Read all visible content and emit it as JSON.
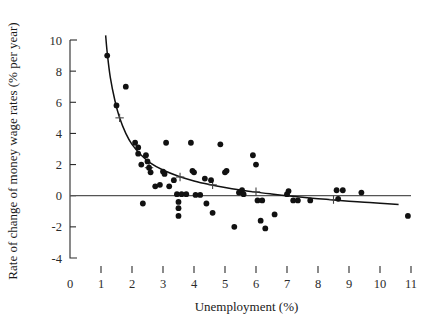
{
  "chart_data": {
    "type": "scatter",
    "title": "",
    "xlabel": "Unemployment (%)",
    "ylabel": "Rate of change of money wage rates (% per year)",
    "xlim": [
      0,
      11
    ],
    "ylim": [
      -4,
      10
    ],
    "grid": false,
    "legend": null,
    "xticks": [
      0,
      1,
      2,
      3,
      4,
      5,
      6,
      7,
      8,
      9,
      10,
      11
    ],
    "xtick_labels": [
      "0",
      "1",
      "2",
      "3",
      "4",
      "5",
      "6",
      "7",
      "8",
      "9",
      "10",
      "11"
    ],
    "yticks": [
      -4,
      -2,
      0,
      2,
      4,
      6,
      8,
      10
    ],
    "ytick_labels": [
      "-4",
      "-2",
      "0",
      "2",
      "4",
      "6",
      "8",
      "10"
    ],
    "points": [
      [
        1.2,
        9.0
      ],
      [
        1.5,
        5.8
      ],
      [
        1.8,
        7.0
      ],
      [
        2.1,
        3.4
      ],
      [
        2.2,
        3.1
      ],
      [
        2.2,
        2.7
      ],
      [
        2.3,
        2.0
      ],
      [
        2.45,
        2.6
      ],
      [
        2.5,
        2.2
      ],
      [
        2.55,
        1.8
      ],
      [
        2.6,
        1.5
      ],
      [
        2.35,
        -0.5
      ],
      [
        2.75,
        0.6
      ],
      [
        2.9,
        0.7
      ],
      [
        3.0,
        1.55
      ],
      [
        3.05,
        1.4
      ],
      [
        3.1,
        3.4
      ],
      [
        3.2,
        0.6
      ],
      [
        3.35,
        1.0
      ],
      [
        3.45,
        0.1
      ],
      [
        3.5,
        -0.4
      ],
      [
        3.5,
        -0.8
      ],
      [
        3.5,
        -1.3
      ],
      [
        3.6,
        0.1
      ],
      [
        3.75,
        0.1
      ],
      [
        3.9,
        3.4
      ],
      [
        3.95,
        1.6
      ],
      [
        4.0,
        1.5
      ],
      [
        4.05,
        0.05
      ],
      [
        4.2,
        0.05
      ],
      [
        4.35,
        1.1
      ],
      [
        4.4,
        -0.5
      ],
      [
        4.55,
        1.0
      ],
      [
        4.6,
        -1.1
      ],
      [
        4.85,
        3.3
      ],
      [
        5.0,
        1.5
      ],
      [
        5.05,
        1.6
      ],
      [
        5.3,
        -2.0
      ],
      [
        5.45,
        0.2
      ],
      [
        5.55,
        0.35
      ],
      [
        5.6,
        0.1
      ],
      [
        5.9,
        2.6
      ],
      [
        6.0,
        2.0
      ],
      [
        6.05,
        -0.3
      ],
      [
        6.2,
        -0.3
      ],
      [
        6.15,
        -1.6
      ],
      [
        6.3,
        -2.1
      ],
      [
        6.6,
        -1.2
      ],
      [
        7.0,
        0.1
      ],
      [
        7.05,
        0.3
      ],
      [
        7.2,
        -0.3
      ],
      [
        7.35,
        -0.3
      ],
      [
        7.75,
        -0.3
      ],
      [
        8.6,
        0.35
      ],
      [
        8.65,
        -0.2
      ],
      [
        8.8,
        0.35
      ],
      [
        9.4,
        0.2
      ],
      [
        10.9,
        -1.3
      ]
    ],
    "fitted_curve": {
      "label": "fitted Phillips curve",
      "points": [
        [
          1.15,
          10.3
        ],
        [
          1.2,
          9.2
        ],
        [
          1.3,
          7.6
        ],
        [
          1.45,
          6.1
        ],
        [
          1.6,
          5.0
        ],
        [
          1.8,
          4.0
        ],
        [
          2.0,
          3.3
        ],
        [
          2.3,
          2.6
        ],
        [
          2.6,
          2.1
        ],
        [
          3.0,
          1.65
        ],
        [
          3.5,
          1.25
        ],
        [
          4.0,
          0.95
        ],
        [
          4.5,
          0.72
        ],
        [
          5.0,
          0.53
        ],
        [
          5.5,
          0.37
        ],
        [
          6.0,
          0.23
        ],
        [
          6.5,
          0.11
        ],
        [
          7.0,
          0.0
        ],
        [
          7.5,
          -0.1
        ],
        [
          8.0,
          -0.19
        ],
        [
          8.5,
          -0.27
        ],
        [
          9.0,
          -0.35
        ],
        [
          9.5,
          -0.42
        ],
        [
          10.0,
          -0.49
        ],
        [
          10.6,
          -0.56
        ]
      ]
    },
    "reference_line": {
      "label": "zero line",
      "y": 0,
      "x_start": 0.0,
      "x_end": 11.0
    },
    "cross_markers": [
      [
        1.6,
        5.0
      ],
      [
        2.55,
        1.8
      ],
      [
        3.55,
        1.2
      ],
      [
        4.6,
        0.7
      ],
      [
        6.0,
        0.25
      ],
      [
        8.5,
        -0.25
      ]
    ]
  },
  "axis_titles": {
    "x": "Unemployment (%)",
    "y": "Rate of change of money wage rates (% per year)"
  },
  "colors": {
    "ink": "#111111",
    "axis": "#2b2b2b",
    "reference": "#555555",
    "background": "#ffffff"
  }
}
